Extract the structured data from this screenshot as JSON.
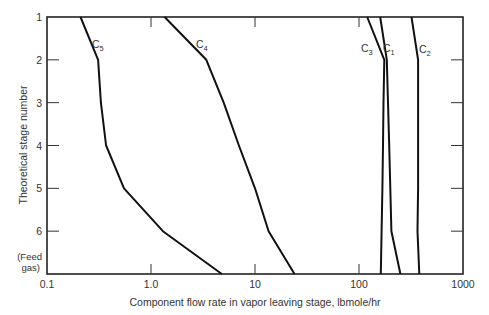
{
  "chart_data": {
    "type": "line",
    "title": "",
    "xlabel": "Component flow rate in vapor leaving stage, lbmole/hr",
    "ylabel": "Theoretical stage number",
    "xscale": "log",
    "xlim": [
      0.1,
      1000
    ],
    "x_ticks": [
      "0.1",
      "1.0",
      "10",
      "100",
      "1000"
    ],
    "y_ticks": [
      "1",
      "2",
      "3",
      "4",
      "5",
      "6",
      "(Feed gas)"
    ],
    "y_tick_values": [
      1,
      2,
      3,
      4,
      5,
      6,
      7
    ],
    "ylim": [
      1,
      7
    ],
    "y_inverted": true,
    "grid": false,
    "legend": "inline curve labels",
    "stages": [
      1,
      2,
      3,
      4,
      5,
      6,
      7
    ],
    "series": [
      {
        "name": "C1",
        "label_main": "C",
        "label_sub": "1",
        "values": [
          160,
          185,
          190,
          195,
          200,
          205,
          250
        ]
      },
      {
        "name": "C2",
        "label_main": "C",
        "label_sub": "2",
        "values": [
          320,
          370,
          370,
          370,
          370,
          365,
          380
        ]
      },
      {
        "name": "C3",
        "label_main": "C",
        "label_sub": "3",
        "values": [
          120,
          175,
          172,
          170,
          168,
          165,
          162
        ]
      },
      {
        "name": "C4",
        "label_main": "C",
        "label_sub": "4",
        "values": [
          1.35,
          3.4,
          5.0,
          7.0,
          10.0,
          13.5,
          24
        ]
      },
      {
        "name": "C5",
        "label_main": "C",
        "label_sub": "5",
        "values": [
          0.21,
          0.31,
          0.33,
          0.37,
          0.55,
          1.3,
          4.8
        ]
      }
    ]
  }
}
